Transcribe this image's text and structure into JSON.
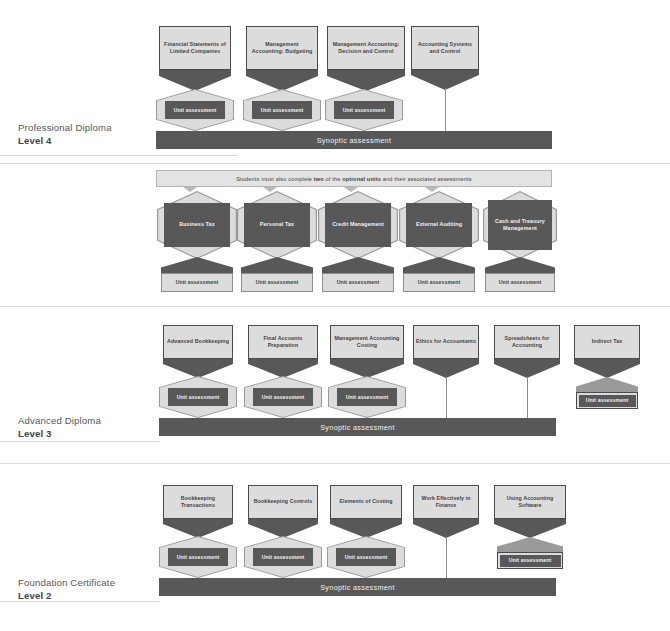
{
  "levels": [
    {
      "name": "Professional Diploma",
      "number": "Level 4",
      "synoptic_label": "Synoptic assessment",
      "units": [
        {
          "title": "Financial Statements of Limited Companies",
          "assessment": "Unit assessment",
          "connector": "hexagon"
        },
        {
          "title": "Management Accounting: Budgeting",
          "assessment": "Unit assessment",
          "connector": "hexagon"
        },
        {
          "title": "Management Accounting: Decision and Control",
          "assessment": "Unit assessment",
          "connector": "hexagon"
        },
        {
          "title": "Accounting Systems and Control",
          "assessment": "",
          "connector": "line"
        }
      ]
    },
    {
      "name": "Advanced Diploma",
      "number": "Level 3",
      "synoptic_label": "Synoptic assessment",
      "units": [
        {
          "title": "Advanced Bookkeeping",
          "assessment": "Unit assessment",
          "connector": "hexagon"
        },
        {
          "title": "Final Accounts Preparation",
          "assessment": "Unit assessment",
          "connector": "hexagon"
        },
        {
          "title": "Management Accounting Costing",
          "assessment": "Unit assessment",
          "connector": "hexagon"
        },
        {
          "title": "Ethics for Accountants",
          "assessment": "",
          "connector": "line"
        },
        {
          "title": "Spreadsheets for Accounting",
          "assessment": "",
          "connector": "line"
        },
        {
          "title": "Indirect Tax",
          "assessment": "Unit assessment",
          "connector": "standalone"
        }
      ]
    },
    {
      "name": "Foundation Certificate",
      "number": "Level 2",
      "synoptic_label": "Synoptic assessment",
      "units": [
        {
          "title": "Bookkeeping Transactions",
          "assessment": "Unit assessment",
          "connector": "hexagon"
        },
        {
          "title": "Bookkeeping Controls",
          "assessment": "Unit assessment",
          "connector": "hexagon"
        },
        {
          "title": "Elements of Costing",
          "assessment": "Unit assessment",
          "connector": "hexagon"
        },
        {
          "title": "Work Effectively in Finance",
          "assessment": "",
          "connector": "line"
        },
        {
          "title": "Using Accounting Software",
          "assessment": "Unit assessment",
          "connector": "standalone"
        }
      ]
    }
  ],
  "optional_section": {
    "banner_prefix": "Students must also complete ",
    "banner_bold_1": "two",
    "banner_mid": " of the ",
    "banner_bold_2": "optional units",
    "banner_suffix": " and their associated assessments",
    "units": [
      {
        "title": "Business Tax",
        "assessment": "Unit assessment"
      },
      {
        "title": "Personal Tax",
        "assessment": "Unit assessment"
      },
      {
        "title": "Credit Management",
        "assessment": "Unit assessment"
      },
      {
        "title": "External Auditing",
        "assessment": "Unit assessment"
      },
      {
        "title": "Cash and Treasury Management",
        "assessment": "Unit assessment"
      }
    ]
  },
  "colors": {
    "dark": "#585858",
    "light": "#dcdcdc",
    "border_dark": "#4a4a4a",
    "border_light": "#9a9a9a",
    "banner": "#e3e3e3",
    "text_dark": "#3f3f3f",
    "text_light": "#f2f2f2",
    "rule": "#d9d9d9"
  }
}
